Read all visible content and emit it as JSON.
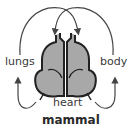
{
  "diagram": {
    "title": "mammal",
    "labels": {
      "lungs": "lungs",
      "body": "body",
      "heart": "heart"
    },
    "colors": {
      "heart_fill": "#a8a8a8",
      "stroke": "#222222",
      "arrow": "#444444"
    }
  }
}
